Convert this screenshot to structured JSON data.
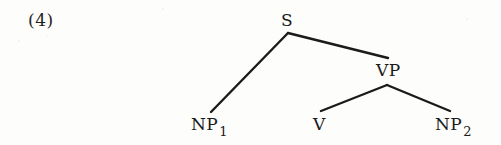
{
  "figure": {
    "example_number": "(4)",
    "caption": "",
    "ink_color": "#1b1b1b",
    "background_color": "#fdfdfc"
  },
  "tree": {
    "type": "phrase-structure-tree",
    "nodes": [
      {
        "id": "s",
        "label": "S",
        "subscript": "",
        "x": 288,
        "y": 20
      },
      {
        "id": "vp",
        "label": "VP",
        "subscript": "",
        "x": 387,
        "y": 70
      },
      {
        "id": "np1",
        "label": "NP",
        "subscript": "1",
        "x": 211,
        "y": 124
      },
      {
        "id": "v",
        "label": "V",
        "subscript": "",
        "x": 318,
        "y": 124
      },
      {
        "id": "np2",
        "label": "NP",
        "subscript": "2",
        "x": 449,
        "y": 124
      }
    ],
    "edges": [
      {
        "from": "s",
        "to": "np1",
        "x1": 288,
        "y1": 33,
        "x2": 211,
        "y2": 112
      },
      {
        "from": "s",
        "to": "vp",
        "x1": 288,
        "y1": 33,
        "x2": 388,
        "y2": 58
      },
      {
        "from": "vp",
        "to": "v",
        "x1": 387,
        "y1": 85,
        "x2": 321,
        "y2": 111
      },
      {
        "from": "vp",
        "to": "np2",
        "x1": 387,
        "y1": 85,
        "x2": 450,
        "y2": 111
      }
    ],
    "rules": [
      "S → NP₁ VP",
      "VP → V NP₂"
    ]
  }
}
